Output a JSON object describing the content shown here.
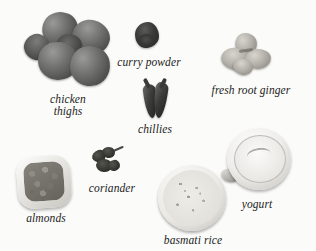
{
  "scene": {
    "title": "curry ingredients photo layout",
    "background_color": "#fbfbfa",
    "label_color": "#1b1b1b",
    "style": "grayscale photograph with italic serif captions"
  },
  "items": [
    {
      "id": "chicken-thighs",
      "label": "chicken\nthighs",
      "label_lines": [
        "chicken",
        "thighs"
      ],
      "icon": "chicken-thighs-icon"
    },
    {
      "id": "curry-powder",
      "label": "curry powder",
      "label_lines": [
        "curry powder"
      ],
      "icon": "curry-powder-icon"
    },
    {
      "id": "fresh-root-ginger",
      "label": "fresh root ginger",
      "label_lines": [
        "fresh root ginger"
      ],
      "icon": "ginger-root-icon"
    },
    {
      "id": "chillies",
      "label": "chillies",
      "label_lines": [
        "chillies"
      ],
      "icon": "chilli-pepper-icon"
    },
    {
      "id": "almonds",
      "label": "almonds",
      "label_lines": [
        "almonds"
      ],
      "icon": "almonds-bowl-icon"
    },
    {
      "id": "coriander",
      "label": "coriander",
      "label_lines": [
        "coriander"
      ],
      "icon": "coriander-leaves-icon"
    },
    {
      "id": "basmati-rice",
      "label": "basmati rice",
      "label_lines": [
        "basmati rice"
      ],
      "icon": "rice-bowl-icon"
    },
    {
      "id": "yogurt",
      "label": "yogurt",
      "label_lines": [
        "yogurt"
      ],
      "icon": "yogurt-jug-icon"
    }
  ]
}
